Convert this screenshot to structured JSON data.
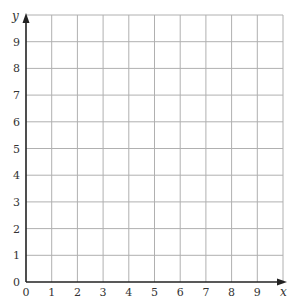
{
  "chart_data": {
    "type": "scatter",
    "title": "",
    "xlabel": "x",
    "ylabel": "y",
    "xlim": [
      0,
      10
    ],
    "ylim": [
      0,
      10
    ],
    "x_ticks": [
      "0",
      "1",
      "2",
      "3",
      "4",
      "5",
      "6",
      "7",
      "8",
      "9"
    ],
    "y_ticks": [
      "0",
      "1",
      "2",
      "3",
      "4",
      "5",
      "6",
      "7",
      "8",
      "9"
    ],
    "grid": true,
    "series": [],
    "colors": {
      "grid": "#b0b0b0",
      "axis": "#222222",
      "text": "#333333"
    }
  }
}
